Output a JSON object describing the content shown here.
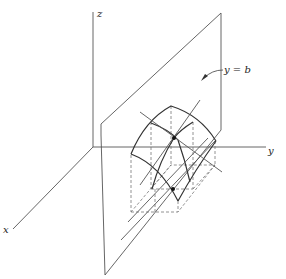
{
  "diagram": {
    "axes": {
      "x_label": "x",
      "y_label": "y",
      "z_label": "z"
    },
    "plane_label": "y = b",
    "colors": {
      "background": "#ffffff",
      "line": "#555555",
      "surface": "#333333",
      "dashed": "#777777"
    },
    "points": {
      "surface_point": "marked point on surface",
      "base_point": "marked point in xy-plane"
    }
  }
}
